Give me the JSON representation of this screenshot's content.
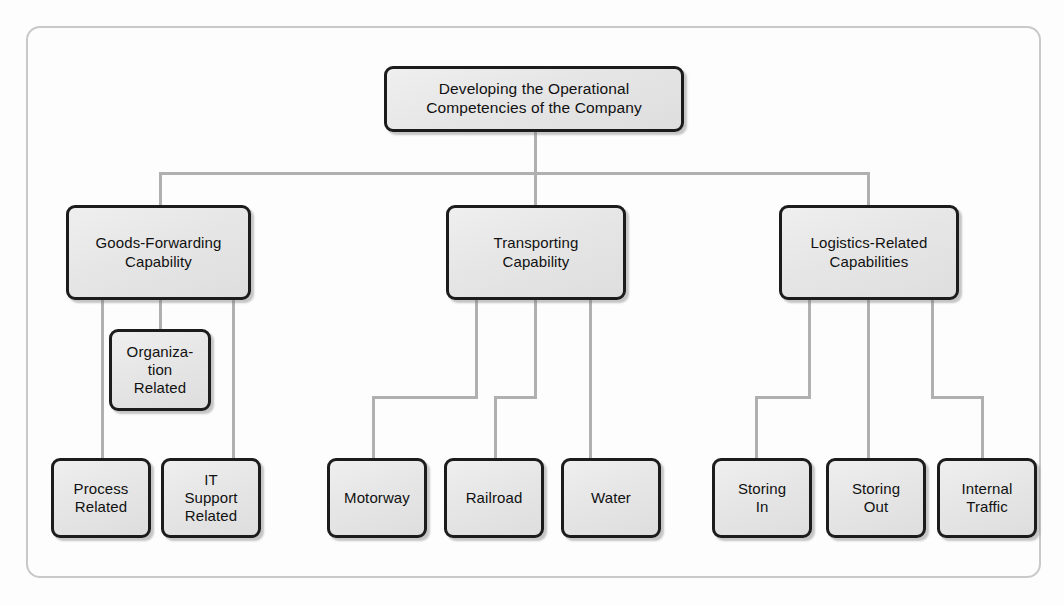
{
  "diagram": {
    "type": "hierarchy-tree",
    "title": "Developing the Operational Competencies of the Company",
    "frame": {
      "style": "rounded-rectangle-border"
    },
    "colors": {
      "node_border": "#1c1c1c",
      "node_fill": "#e8e8e8",
      "connector": "#b0b0b0",
      "frame_border": "#c9c9c9",
      "text": "#111111",
      "background": "#ffffff"
    },
    "root": {
      "id": "root",
      "label": "Developing the Operational\nCompetencies of the Company"
    },
    "branches": [
      {
        "id": "goods-forwarding",
        "label": "Goods-Forwarding\nCapability",
        "children": [
          {
            "id": "process-related",
            "label": "Process\nRelated"
          },
          {
            "id": "organization-related",
            "label": "Organiza-\ntion\nRelated"
          },
          {
            "id": "it-support-related",
            "label": "IT\nSupport\nRelated"
          }
        ]
      },
      {
        "id": "transporting",
        "label": "Transporting\nCapability",
        "children": [
          {
            "id": "motorway",
            "label": "Motorway"
          },
          {
            "id": "railroad",
            "label": "Railroad"
          },
          {
            "id": "water",
            "label": "Water"
          }
        ]
      },
      {
        "id": "logistics-related",
        "label": "Logistics-Related\nCapabilities",
        "children": [
          {
            "id": "storing-in",
            "label": "Storing\nIn"
          },
          {
            "id": "storing-out",
            "label": "Storing\nOut"
          },
          {
            "id": "internal-traffic",
            "label": "Internal\nTraffic"
          }
        ]
      }
    ]
  }
}
